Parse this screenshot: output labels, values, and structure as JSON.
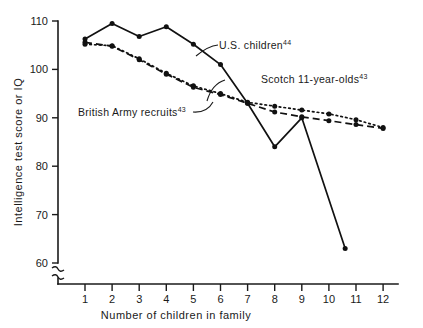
{
  "chart_data": {
    "type": "line",
    "title": "",
    "xlabel": "Number of children in family",
    "ylabel": "Intelligence test score or IQ",
    "xlim": [
      0.4,
      12.6
    ],
    "ylim": [
      58,
      112
    ],
    "y_axis_break": true,
    "grid": false,
    "legend_position": "inline-annotations",
    "xticks": [
      1,
      2,
      3,
      4,
      5,
      6,
      7,
      8,
      9,
      10,
      11,
      12
    ],
    "xtick_labels": [
      "1",
      "2",
      "3",
      "4",
      "5",
      "6",
      "7",
      "8",
      "9",
      "10",
      "11",
      "12"
    ],
    "yticks": [
      60,
      70,
      80,
      90,
      100,
      110
    ],
    "ytick_labels": [
      "60",
      "70",
      "80",
      "90",
      "100",
      "110"
    ],
    "series": [
      {
        "name": "U.S. children",
        "reference": "44",
        "style": "solid",
        "label_text": "U.S. children",
        "x": [
          1,
          2,
          3,
          4,
          5,
          6,
          7,
          8,
          9,
          10.6
        ],
        "values": [
          106.3,
          109.5,
          106.8,
          108.8,
          105.2,
          101.0,
          93.0,
          84.0,
          90.0,
          63.0
        ]
      },
      {
        "name": "British Army recruits",
        "reference": "43",
        "style": "dashed",
        "label_text": "British Army recruits",
        "x": [
          1,
          2,
          3,
          4,
          5,
          6,
          7,
          8,
          9,
          10,
          11,
          12
        ],
        "values": [
          105.6,
          104.8,
          102.0,
          99.0,
          96.3,
          94.8,
          93.0,
          91.2,
          90.2,
          89.4,
          88.6,
          87.8
        ]
      },
      {
        "name": "Scotch 11-year-olds",
        "reference": "43",
        "style": "dotted",
        "label_text": "Scotch 11-year-olds",
        "x": [
          1,
          2,
          3,
          4,
          5,
          6,
          7,
          8,
          9,
          10,
          11,
          12
        ],
        "values": [
          105.2,
          104.9,
          102.2,
          99.2,
          96.6,
          95.0,
          93.2,
          92.4,
          91.6,
          90.8,
          89.6,
          88.0
        ]
      }
    ],
    "annotations": [
      {
        "text": "U.S. children",
        "sup": "44"
      },
      {
        "text": "Scotch 11-year-olds",
        "sup": "43"
      },
      {
        "text": "British Army recruits",
        "sup": "43"
      }
    ]
  }
}
